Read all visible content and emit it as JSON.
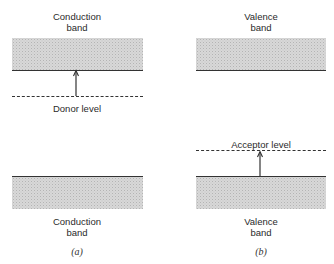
{
  "panels": [
    {
      "id": "a",
      "caption": "(a)",
      "top_band_label": [
        "Conduction",
        "band"
      ],
      "bottom_band_label": [
        "Conduction",
        "band"
      ],
      "level_label": "Donor level",
      "level_type": "donor",
      "arrow_direction": "up"
    },
    {
      "id": "b",
      "caption": "(b)",
      "top_band_label": [
        "Valence",
        "band"
      ],
      "bottom_band_label": [
        "Valence",
        "band"
      ],
      "level_label": "Acceptor level",
      "level_type": "acceptor",
      "arrow_direction": "up"
    }
  ],
  "colors": {
    "band_fill": "#d8d8d8",
    "line": "#333333",
    "background": "#ffffff"
  }
}
